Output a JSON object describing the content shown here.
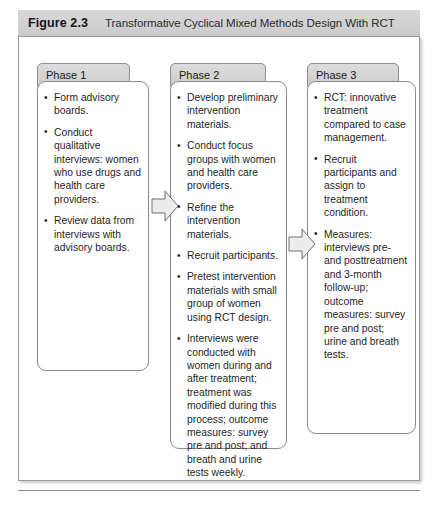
{
  "figure": {
    "number": "Figure 2.3",
    "title": "Transformative Cyclical Mixed Methods Design With RCT"
  },
  "colors": {
    "caption_bar": "#d2d2d2",
    "tab_fill": "#d4d4d4",
    "border": "#8a8a8a",
    "arrow_fill": "#e8e8e8",
    "text": "#1f1f1f"
  },
  "phases": [
    {
      "tab_label": "Phase 1",
      "items": [
        "Form advisory boards.",
        "Conduct qualitative interviews: women who use drugs and health care providers.",
        "Review data from interviews with advisory boards."
      ]
    },
    {
      "tab_label": "Phase 2",
      "items": [
        "Develop preliminary intervention materials.",
        "Conduct focus groups with women and health care providers.",
        "Refine the intervention materials.",
        "Recruit participants.",
        "Pretest intervention materials with small group of women using RCT design.",
        "Interviews were conducted with women during and after treatment; treatment was modified during this process; outcome measures: survey pre and post; and breath and urine tests weekly."
      ]
    },
    {
      "tab_label": "Phase 3",
      "items": [
        "RCT: innovative treatment compared to case management.",
        "Recruit participants and assign to treatment condition.",
        "Measures: interviews pre- and posttreatment and 3-month follow-up; outcome measures: survey pre and post; urine and breath tests."
      ]
    }
  ],
  "arrows": [
    {
      "name": "arrow-phase1-to-phase2",
      "direction": "right"
    },
    {
      "name": "arrow-phase2-to-phase3",
      "direction": "right"
    }
  ]
}
